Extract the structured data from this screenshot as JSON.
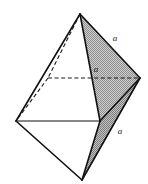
{
  "figure": {
    "name": "octahedron-edge-length-diagram",
    "canvas": {
      "width": 148,
      "height": 184,
      "background": "#ffffff"
    },
    "colors": {
      "line": "#111111",
      "hidden_line": "#1a1a1a",
      "shaded_face": "#b0b0b0",
      "shaded_face_dark": "#9a9a9a",
      "white_face": "#ffffff",
      "label": "#1a1a1a"
    },
    "vertices": [
      {
        "id": "top-apex",
        "label": "top apex",
        "x": 80,
        "y": 14,
        "hidden": false
      },
      {
        "id": "back",
        "label": "back corner",
        "x": 48,
        "y": 78,
        "hidden": true
      },
      {
        "id": "right",
        "label": "right corner",
        "x": 140,
        "y": 78,
        "hidden": false
      },
      {
        "id": "left",
        "label": "left corner",
        "x": 16,
        "y": 121,
        "hidden": false
      },
      {
        "id": "front",
        "label": "front corner",
        "x": 100,
        "y": 121,
        "hidden": false
      },
      {
        "id": "bottom-apex",
        "label": "bottom apex",
        "x": 82,
        "y": 180,
        "hidden": false
      }
    ],
    "faces": [
      {
        "id": "upper-right-face",
        "shaded": true,
        "points": "80,14 140,78 100,121",
        "fill": "#b0b0b0"
      },
      {
        "id": "lower-right-face",
        "shaded": true,
        "points": "140,78 100,121 82,180",
        "fill": "#9a9a9a"
      },
      {
        "id": "upper-left-face",
        "shaded": false,
        "points": "80,14 100,121 16,121",
        "fill": "#ffffff"
      },
      {
        "id": "lower-left-face",
        "shaded": false,
        "points": "16,121 100,121 82,180",
        "fill": "#ffffff"
      }
    ],
    "edges": [
      {
        "id": "apex-to-left",
        "from": "top-apex",
        "to": "left",
        "style": "solid",
        "path": "M 80 14 L 16 121"
      },
      {
        "id": "apex-to-front",
        "from": "top-apex",
        "to": "front",
        "style": "solid",
        "path": "M 80 14 L 100 121"
      },
      {
        "id": "apex-to-right",
        "from": "top-apex",
        "to": "right",
        "style": "solid",
        "path": "M 80 14 L 140 78"
      },
      {
        "id": "apex-to-back",
        "from": "top-apex",
        "to": "back",
        "style": "dashed",
        "path": "M 80 14 L 48 78"
      },
      {
        "id": "back-to-left",
        "from": "back",
        "to": "left",
        "style": "dashed",
        "path": "M 48 78 L 16 121"
      },
      {
        "id": "back-to-right",
        "from": "back",
        "to": "right",
        "style": "dashed",
        "path": "M 48 78 L 140 78"
      },
      {
        "id": "left-to-front",
        "from": "left",
        "to": "front",
        "style": "solid-thin",
        "path": "M 16 121 L 100 121"
      },
      {
        "id": "right-to-front",
        "from": "right",
        "to": "front",
        "style": "solid",
        "path": "M 140 78 L 100 121"
      },
      {
        "id": "right-to-bottom",
        "from": "right",
        "to": "bottom-apex",
        "style": "solid",
        "path": "M 140 78 L 82 180"
      },
      {
        "id": "front-to-bottom",
        "from": "front",
        "to": "bottom-apex",
        "style": "solid",
        "path": "M 100 121 L 82 180"
      },
      {
        "id": "left-to-bottom",
        "from": "left",
        "to": "bottom-apex",
        "style": "solid",
        "path": "M 16 121 L 82 180"
      }
    ],
    "labels": [
      {
        "id": "label-edge-upper-right",
        "text": "a",
        "x": 115,
        "y": 38,
        "edge": "apex-to-right"
      },
      {
        "id": "label-edge-back-right",
        "text": "a",
        "x": 96,
        "y": 69,
        "edge": "back-to-right"
      },
      {
        "id": "label-edge-lower-right",
        "text": "a",
        "x": 120,
        "y": 131,
        "edge": "right-to-bottom"
      }
    ]
  }
}
